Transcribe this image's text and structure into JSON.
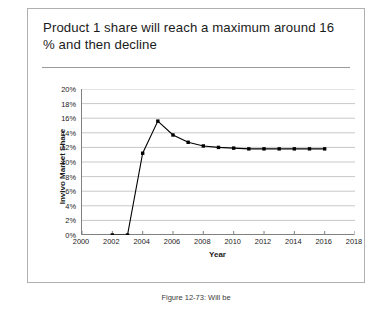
{
  "slide": {
    "title": "Product 1 share will reach a maximum around 16 % and then decline"
  },
  "caption": "Figure 12-73: Will be",
  "colors": {
    "frame_border": "#b0b0b0",
    "title_rule": "#9a9a9a",
    "gridline": "#c8c8c8",
    "axis": "#808080",
    "series_line": "#000000",
    "marker": "#000000",
    "background": "#ffffff",
    "text": "#1b1b1b"
  },
  "chart_data": {
    "type": "line",
    "title": "",
    "xlabel": "Year",
    "ylabel": "Invivo Market Share",
    "xlim": [
      2000,
      2018
    ],
    "ylim": [
      0,
      20
    ],
    "xticks": [
      2000,
      2002,
      2004,
      2006,
      2008,
      2010,
      2012,
      2014,
      2016,
      2018
    ],
    "yticks": [
      0,
      2,
      4,
      6,
      8,
      10,
      12,
      14,
      16,
      18,
      20
    ],
    "ytick_labels": [
      "0%",
      "2%",
      "4%",
      "6%",
      "8%",
      "10%",
      "12%",
      "14%",
      "16%",
      "18%",
      "20%"
    ],
    "xtick_labels": [
      "2000",
      "2002",
      "2004",
      "2006",
      "2008",
      "2010",
      "2012",
      "2014",
      "2016",
      "2018"
    ],
    "grid": "horizontal",
    "legend": "none",
    "markers": "square",
    "series": [
      {
        "name": "Product 1 market share",
        "x": [
          2002,
          2003,
          2004,
          2005,
          2006,
          2007,
          2008,
          2009,
          2010,
          2011,
          2012,
          2013,
          2014,
          2015,
          2016
        ],
        "values": [
          0.0,
          0.0,
          11.2,
          15.6,
          13.7,
          12.7,
          12.2,
          12.0,
          11.9,
          11.8,
          11.8,
          11.8,
          11.8,
          11.8,
          11.8
        ]
      }
    ]
  }
}
